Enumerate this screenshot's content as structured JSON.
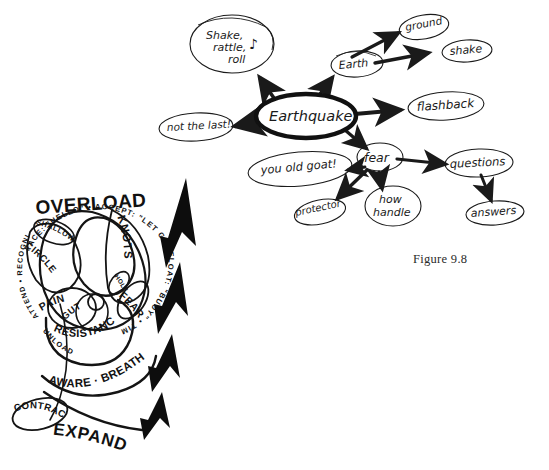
{
  "figure": {
    "caption": "Figure 9.8",
    "background_color": "#ffffff",
    "ink_color": "#1a1a1a"
  },
  "mindmap": {
    "name": "earthquake-mind-map",
    "center_node": {
      "label": "Earthquake"
    },
    "nodes": [
      {
        "id": "shake-rattle-roll",
        "label": "Shake,",
        "label2": "rattle,",
        "label3": "roll",
        "glyph": "♪"
      },
      {
        "id": "not-the-last",
        "label": "not the last!"
      },
      {
        "id": "earth",
        "label": "Earth"
      },
      {
        "id": "ground",
        "label": "ground"
      },
      {
        "id": "shake",
        "label": "shake"
      },
      {
        "id": "flashback",
        "label": "flashback"
      },
      {
        "id": "fear",
        "label": "fear"
      },
      {
        "id": "you-old-goat",
        "label": "you old goat!"
      },
      {
        "id": "protector",
        "label": "protector"
      },
      {
        "id": "how-handle",
        "label": "how",
        "label2": "handle"
      },
      {
        "id": "questions",
        "label": "questions"
      },
      {
        "id": "answers",
        "label": "answers"
      }
    ],
    "edges": [
      {
        "from": "Earthquake",
        "to": "Shake, rattle, roll"
      },
      {
        "from": "Earthquake",
        "to": "not the last!"
      },
      {
        "from": "Earthquake",
        "to": "Earth"
      },
      {
        "from": "Earthquake",
        "to": "flashback"
      },
      {
        "from": "Earthquake",
        "to": "fear"
      },
      {
        "from": "Earth",
        "to": "ground"
      },
      {
        "from": "Earth",
        "to": "shake"
      },
      {
        "from": "fear",
        "to": "you old goat!"
      },
      {
        "from": "fear",
        "to": "protector"
      },
      {
        "from": "fear",
        "to": "how handle"
      },
      {
        "from": "fear",
        "to": "questions"
      },
      {
        "from": "questions",
        "to": "answers"
      }
    ]
  },
  "spiral": {
    "name": "overload-spiral-diagram",
    "ring_text_top": "FACE: \"HELLO\"  •  ACCEPT: \"LET GO\"",
    "ring_text_right": "FLOAT: \"BUOY\"  •  TIME: \"NOW\"",
    "ring_text_left": "ATTEND  •  RECOGNIZE  •  FACE",
    "ring_text_bottom": "UNLOAD",
    "headline": "OVERLOAD",
    "inner_labels": [
      {
        "id": "shallow",
        "text": "SHALLOW"
      },
      {
        "id": "circle",
        "text": "CIRCLE"
      },
      {
        "id": "pain",
        "text": "PAIN"
      },
      {
        "id": "gut",
        "text": "GUT"
      },
      {
        "id": "knots",
        "text": "KNOTS"
      },
      {
        "id": "hole",
        "text": "HOLE"
      },
      {
        "id": "fear",
        "text": "FEAR"
      },
      {
        "id": "resistance",
        "text": "RESISTANCE"
      },
      {
        "id": "aware-breathe",
        "text": "AWARE · BREATHE"
      },
      {
        "id": "contract",
        "text": "CONTRACT"
      },
      {
        "id": "expand",
        "text": "EXPAND"
      }
    ],
    "arrow_stack": {
      "name": "expand-arrow-stack",
      "count": 4,
      "color": "#0d0d0d"
    }
  }
}
